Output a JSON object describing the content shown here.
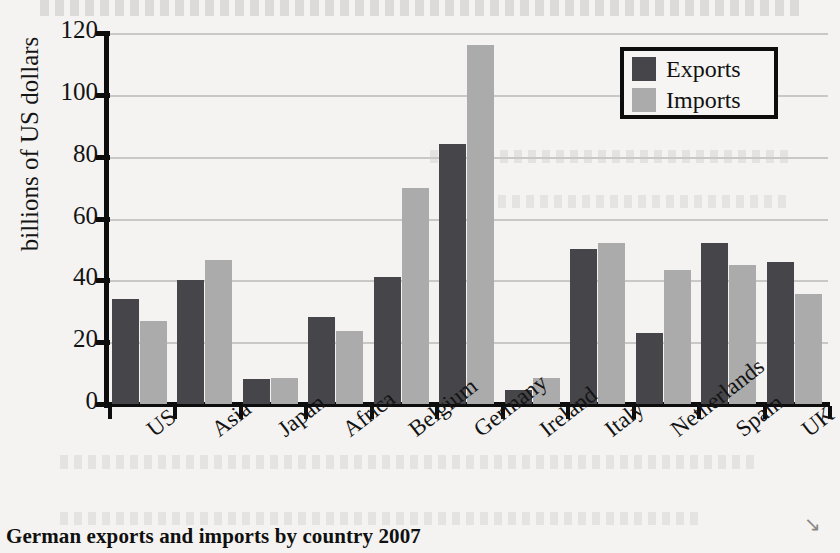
{
  "caption": "German exports and imports by country 2007",
  "legend": {
    "items": [
      {
        "label": "Exports",
        "color": "#45454a"
      },
      {
        "label": "Imports",
        "color": "#ababab"
      }
    ]
  },
  "axes": {
    "ylabel": "billions of US dollars",
    "yticks": [
      "0",
      "20",
      "40",
      "60",
      "80",
      "100",
      "120"
    ]
  },
  "chart_data": {
    "type": "bar",
    "title": "German exports and imports by country 2007",
    "xlabel": "",
    "ylabel": "billions of US dollars",
    "ylim": [
      0,
      120
    ],
    "ytick_step": 20,
    "grid": true,
    "legend_position": "top-right",
    "categories": [
      "US",
      "Asia",
      "Japan",
      "Africa",
      "Belgium",
      "Germany",
      "Ireland",
      "Italy",
      "Netherlands",
      "Spain",
      "UK"
    ],
    "series": [
      {
        "name": "Exports",
        "color": "#45454a",
        "values": [
          34,
          40,
          8,
          28,
          41,
          84,
          4.5,
          50,
          23,
          52,
          46
        ]
      },
      {
        "name": "Imports",
        "color": "#ababab",
        "values": [
          27,
          46.5,
          8.5,
          23.5,
          70,
          116,
          8.5,
          52,
          43.5,
          45,
          35.5
        ]
      }
    ]
  }
}
